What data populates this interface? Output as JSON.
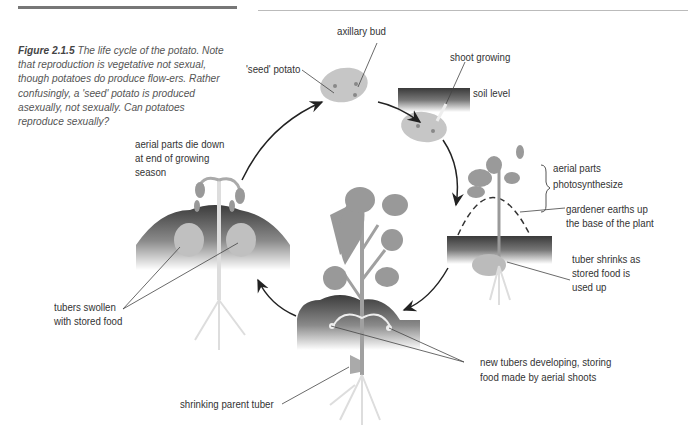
{
  "figure": {
    "number": "Figure 2.1.5",
    "caption": " The life cycle of the potato. Note that reproduction is vegetative not sexual, though potatoes do produce flow-ers. Rather confusingly, a 'seed' potato is produced asexually, not sexually. Can potatoes reproduce sexually?"
  },
  "labels": {
    "axillary_bud": "axillary bud",
    "seed_potato": "'seed' potato",
    "shoot_growing": "shoot growing",
    "soil_level": "soil level",
    "aerial_parts_1": "aerial parts",
    "aerial_parts_2": "photosynthesize",
    "gardener_1": "gardener earths up",
    "gardener_2": "the base of the plant",
    "tuber_shrinks_1": "tuber shrinks as",
    "tuber_shrinks_2": "stored food is",
    "tuber_shrinks_3": "used up",
    "new_tubers_1": "new tubers developing, storing",
    "new_tubers_2": "food made by aerial shoots",
    "parent_tuber": "shrinking parent tuber",
    "tubers_swollen_1": "tubers swollen",
    "tubers_swollen_2": "with stored food",
    "die_down_1": "aerial parts die down",
    "die_down_2": "at end of growing",
    "die_down_3": "season"
  },
  "colors": {
    "soil_dark": "#4a4a4a",
    "plant": "#9a9a9a",
    "tuber": "#c4c4c4",
    "text": "#333333"
  }
}
